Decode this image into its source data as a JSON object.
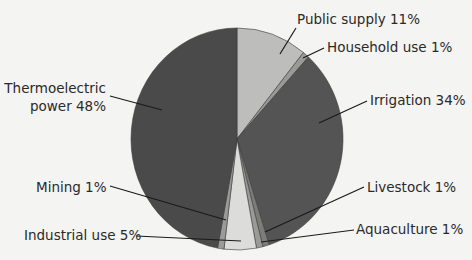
{
  "chart_data": {
    "type": "pie",
    "title": "",
    "start": "top, clockwise",
    "slices": [
      {
        "name": "Public supply",
        "label": "Public supply 11%",
        "value": 11,
        "color": "#bdbdbb"
      },
      {
        "name": "Household use",
        "label": "Household use 1%",
        "value": 1,
        "color": "#9a9a98"
      },
      {
        "name": "Irrigation",
        "label": "Irrigation 34%",
        "value": 34,
        "color": "#545454"
      },
      {
        "name": "Livestock",
        "label": "Livestock 1%",
        "value": 1,
        "color": "#7c7c7a"
      },
      {
        "name": "Aquaculture",
        "label": "Aquaculture 1%",
        "value": 1,
        "color": "#9a9a98"
      },
      {
        "name": "Industrial use",
        "label": "Industrial use 5%",
        "value": 5,
        "color": "#dcdcda"
      },
      {
        "name": "Mining",
        "label": "Mining 1%",
        "value": 1,
        "color": "#9a9a98"
      },
      {
        "name": "Thermoelectric power",
        "label": "Thermoelectric power 48%",
        "label_lines": [
          "Thermoelectric",
          "power 48%"
        ],
        "value": 48,
        "color": "#4a4a4a"
      }
    ]
  }
}
